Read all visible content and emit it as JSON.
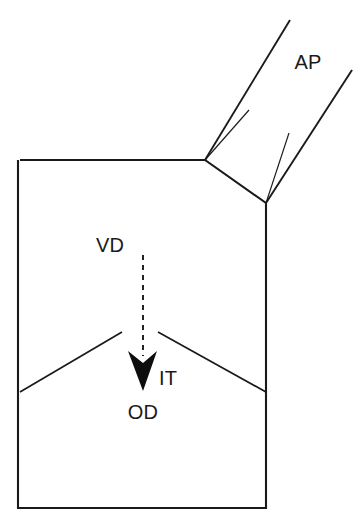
{
  "figure": {
    "type": "anatomical-schematic-diagram",
    "background_color": "#ffffff",
    "line_color": "#1a1a1a",
    "width": 361,
    "height": 526
  },
  "labels": {
    "ap": "AP",
    "vd": "VD",
    "it": "IT",
    "od": "OD"
  },
  "label_positions": {
    "ap": {
      "x": 308,
      "y": 62
    },
    "vd": {
      "x": 110,
      "y": 245
    },
    "it": {
      "x": 168,
      "y": 378
    },
    "od": {
      "x": 143,
      "y": 412
    }
  },
  "geometry": {
    "body_outline_points": "20,160 205,160 266,203 266,508 18,508 18,160",
    "upper_branch_major": {
      "x1": 205,
      "y1": 160,
      "x2": 290,
      "y2": 20
    },
    "upper_branch_minor": {
      "x1": 205,
      "y1": 160,
      "x2": 249,
      "y2": 110
    },
    "lower_branch_major": {
      "x1": 266,
      "y1": 203,
      "x2": 352,
      "y2": 70
    },
    "lower_branch_minor": {
      "x1": 266,
      "y1": 203,
      "x2": 289,
      "y2": 133
    },
    "septum_left": {
      "x1": 20,
      "y1": 392,
      "x2": 122,
      "y2": 332
    },
    "septum_right": {
      "x1": 158,
      "y1": 332,
      "x2": 266,
      "y2": 392
    },
    "flow_arrow_shaft": {
      "x1": 143,
      "y1": 255,
      "x2": 143,
      "y2": 356
    },
    "flow_arrow_head_points": "128,351 143,363 157,351 143,391"
  }
}
